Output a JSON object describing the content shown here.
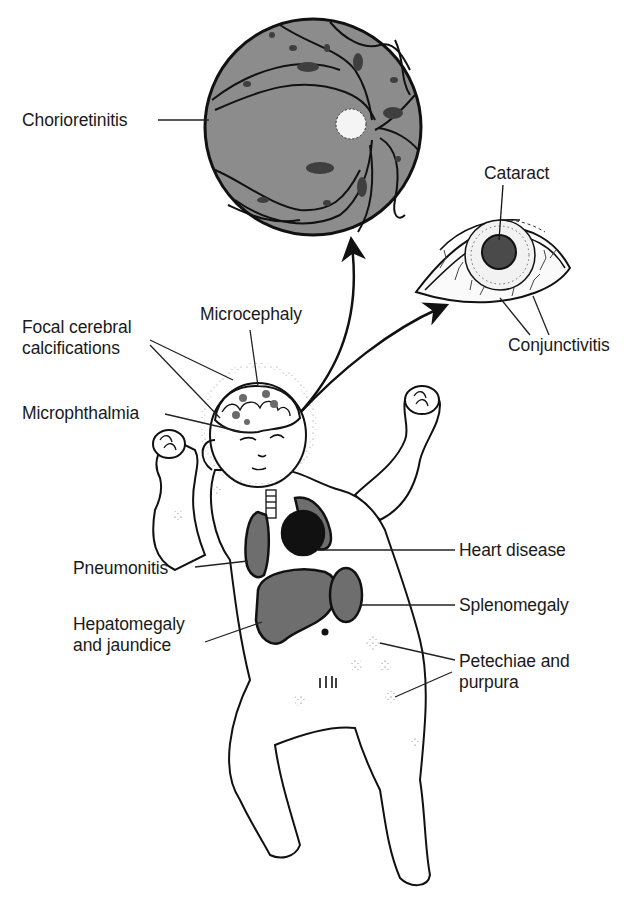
{
  "diagram": {
    "colors": {
      "background": "#ffffff",
      "ink": "#1a1a1a",
      "organ_fill": "#6e6e6e",
      "fundus_fill": "#8c8c8c",
      "lesion_fill": "#3f3f3f",
      "heart_fill": "#111111"
    },
    "labels": {
      "chorioretinitis": "Chorioretinitis",
      "cataract": "Cataract",
      "conjunctivitis": "Conjunctivitis",
      "microcephaly": "Microcephaly",
      "focal_calcifications_line1": "Focal cerebral",
      "focal_calcifications_line2": "calcifications",
      "microphthalmia": "Microphthalmia",
      "pneumonitis": "Pneumonitis",
      "heart_disease": "Heart disease",
      "splenomegaly": "Splenomegaly",
      "hepatomegaly_line1": "Hepatomegaly",
      "hepatomegaly_line2": "and jaundice",
      "petechiae_line1": "Petechiae and",
      "petechiae_line2": "purpura"
    },
    "insets": [
      {
        "name": "fundus",
        "depicts": "retina with chorioretinitis lesions"
      },
      {
        "name": "eye",
        "depicts": "eye with cataract and conjunctivitis"
      }
    ]
  }
}
